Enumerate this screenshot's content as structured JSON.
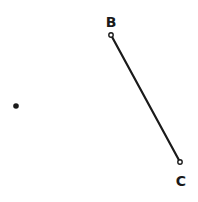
{
  "diagram": {
    "points": [
      {
        "id": "A",
        "label": "",
        "x": 16,
        "y": 106
      },
      {
        "id": "B",
        "label": "B",
        "x": 111,
        "y": 35,
        "label_x": 111,
        "label_y": 27
      },
      {
        "id": "C",
        "label": "C",
        "x": 180,
        "y": 162,
        "label_x": 181,
        "label_y": 186
      }
    ],
    "segments": [
      {
        "from": "B",
        "to": "C"
      }
    ],
    "colors": {
      "ink": "#1a1a1a",
      "background": "#ffffff"
    }
  }
}
